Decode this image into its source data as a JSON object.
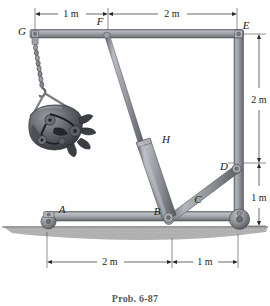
{
  "figure": {
    "caption": "Prob. 6-87",
    "background_color": "#ffffff",
    "metal_color": "#8d9196",
    "metal_light": "#c9ccd0",
    "metal_dark": "#5e6368",
    "ground_color": "#a8a8a8",
    "label_color": "#1a1a1a"
  },
  "joint_labels": [
    {
      "id": "G",
      "text": "G",
      "x": 22,
      "y": 32,
      "desc": "top-left pin of horizontal boom"
    },
    {
      "id": "F",
      "text": "F",
      "x": 100,
      "y": 23,
      "desc": "cylinder upper attachment on boom"
    },
    {
      "id": "E",
      "text": "E",
      "x": 243,
      "y": 28,
      "desc": "top-right corner of frame"
    },
    {
      "id": "D",
      "text": "D",
      "x": 221,
      "y": 166,
      "desc": "pin where diagonal link meets mast"
    },
    {
      "id": "C",
      "text": "C",
      "x": 196,
      "y": 198,
      "desc": "lower mast point above wheel"
    },
    {
      "id": "B",
      "text": "B",
      "x": 157,
      "y": 213,
      "desc": "pin on base beam, cylinder + link"
    },
    {
      "id": "A",
      "text": "A",
      "x": 60,
      "y": 214,
      "desc": "left caster wheel of base beam"
    },
    {
      "id": "H",
      "text": "H",
      "x": 162,
      "y": 140,
      "desc": "hydraulic cylinder member label"
    }
  ],
  "dimensions": {
    "top": [
      {
        "label": "1 m",
        "from": "G",
        "to": "F",
        "x1": 35,
        "x2": 108,
        "y": 14,
        "text_x": 71,
        "text_y": 11
      },
      {
        "label": "2 m",
        "from": "F",
        "to": "E",
        "x1": 108,
        "x2": 237,
        "y": 14,
        "text_x": 172,
        "text_y": 11
      }
    ],
    "right": [
      {
        "label": "2 m",
        "from": "E",
        "to": "D",
        "y1": 34,
        "y2": 163,
        "x": 259,
        "text_x": 259,
        "text_y": 99
      },
      {
        "label": "1 m",
        "from": "D",
        "to": "ground",
        "y1": 163,
        "y2": 228,
        "x": 259,
        "text_x": 259,
        "text_y": 197
      }
    ],
    "bottom": [
      {
        "label": "2 m",
        "from": "A",
        "to": "B",
        "x1": 47,
        "x2": 172,
        "y": 262,
        "text_x": 110,
        "text_y": 259
      },
      {
        "label": "1 m",
        "from": "B",
        "to": "C",
        "x1": 172,
        "x2": 238,
        "y": 262,
        "text_x": 205,
        "text_y": 259
      }
    ]
  },
  "members": {
    "top_boom": {
      "from": "G",
      "to": "E",
      "x1": 33,
      "y1": 33,
      "x2": 239,
      "y2": 33,
      "thickness": 8
    },
    "mast": {
      "from": "E",
      "to": "C",
      "x1": 239,
      "y1": 33,
      "x2": 239,
      "y2": 222,
      "thickness": 8
    },
    "base_beam": {
      "from": "A",
      "to": "C",
      "x1": 48,
      "y1": 216,
      "x2": 240,
      "y2": 216,
      "thickness": 9
    },
    "hydraulic_H": {
      "from": "F",
      "to": "B",
      "x1": 107,
      "y1": 35,
      "x2": 168,
      "y2": 212
    },
    "diagonal_link": {
      "from": "B",
      "to": "D",
      "x1": 168,
      "y1": 212,
      "x2": 236,
      "y2": 163,
      "thickness": 7
    }
  },
  "ground": {
    "y": 226,
    "height": 14,
    "x1": 0,
    "x2": 270
  },
  "load": {
    "name": "engine",
    "description": "automobile engine suspended by chain and sling",
    "chain": {
      "x": 43,
      "y_top": 44,
      "y_bottom": 86
    },
    "sling_apex": {
      "x": 47,
      "y": 90
    },
    "engine_center": {
      "x": 60,
      "y": 118
    }
  },
  "wheels": [
    {
      "id": "A",
      "cx": 48,
      "cy": 221,
      "r": 7.5
    },
    {
      "id": "C",
      "cx": 239,
      "cy": 219,
      "r": 10
    }
  ]
}
